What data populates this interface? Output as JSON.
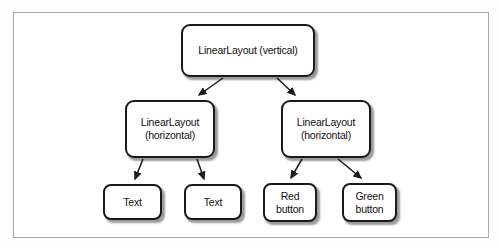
{
  "diagram": {
    "type": "tree",
    "nodes": {
      "root": {
        "label": "LinearLayout (vertical)"
      },
      "left": {
        "label": "LinearLayout\n(horizontal)"
      },
      "right": {
        "label": "LinearLayout\n(horizontal)"
      },
      "leaf1": {
        "label": "Text"
      },
      "leaf2": {
        "label": "Text"
      },
      "leaf3": {
        "label": "Red\nbutton"
      },
      "leaf4": {
        "label": "Green\nbutton"
      }
    },
    "edges": [
      {
        "from": "root",
        "to": "left"
      },
      {
        "from": "root",
        "to": "right"
      },
      {
        "from": "left",
        "to": "leaf1"
      },
      {
        "from": "left",
        "to": "leaf2"
      },
      {
        "from": "right",
        "to": "leaf3"
      },
      {
        "from": "right",
        "to": "leaf4"
      }
    ],
    "colors": {
      "box_border": "#1a1a1a",
      "box_fill": "#ffffff",
      "arrow": "#1a1a1a",
      "frame_border": "#a8a8a8",
      "background": "#ffffff"
    }
  }
}
